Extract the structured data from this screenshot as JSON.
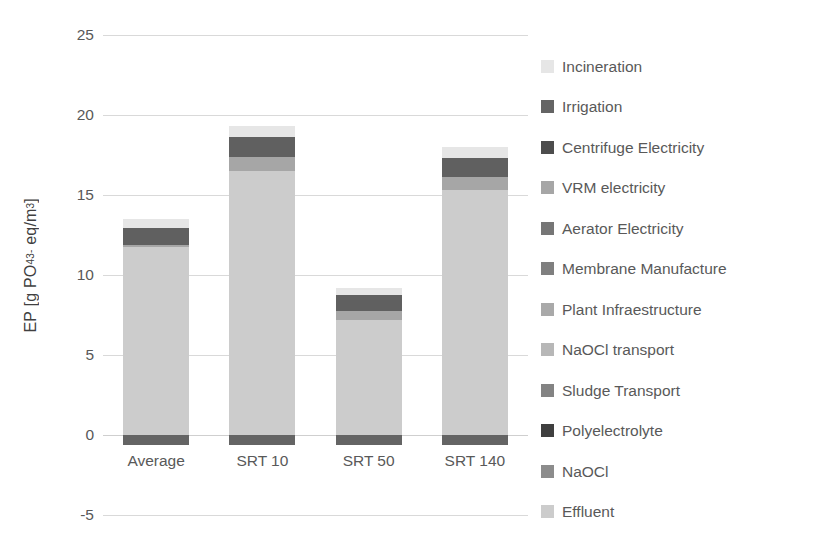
{
  "chart_data": {
    "type": "bar",
    "stacked": true,
    "title": "",
    "xlabel": "",
    "ylabel": "EP [g PO4 3- eq/m3]",
    "ylabel_parts": {
      "prefix": "EP [g PO",
      "sub": "4",
      "sup": "3-",
      "suffix": " eq/m",
      "unit_sup": "3",
      "close": "]"
    },
    "categories": [
      "Average",
      "SRT 10",
      "SRT 50",
      "SRT 140"
    ],
    "ylim": [
      -5,
      25
    ],
    "yticks": [
      25,
      20,
      15,
      10,
      5,
      0,
      -5
    ],
    "grid": true,
    "legend_position": "right",
    "series": [
      {
        "name": "Incineration",
        "color": "#e6e6e6",
        "values": [
          0.55,
          0.7,
          0.45,
          0.7
        ]
      },
      {
        "name": "Irrigation",
        "color": "#646464",
        "values": [
          -0.6,
          -0.6,
          -0.6,
          -0.6
        ]
      },
      {
        "name": "Centrifuge Electricity",
        "color": "#606060",
        "values": [
          1.1,
          1.2,
          1.0,
          1.15
        ]
      },
      {
        "name": "VRM electricity",
        "color": "#a6a6a6",
        "values": [
          0.1,
          0.9,
          0.55,
          0.85
        ]
      },
      {
        "name": "Aerator Electricity",
        "color": "#767676",
        "values": [
          0.0,
          0.0,
          0.0,
          0.0
        ]
      },
      {
        "name": "Membrane Manufacture",
        "color": "#7f7f7f",
        "values": [
          0.0,
          0.0,
          0.0,
          0.0
        ]
      },
      {
        "name": "Plant Infraestructure",
        "color": "#a9a9a9",
        "values": [
          0.0,
          0.0,
          0.0,
          0.0
        ]
      },
      {
        "name": "NaOCl transport",
        "color": "#b7b7b7",
        "values": [
          0.0,
          0.0,
          0.0,
          0.0
        ]
      },
      {
        "name": "Sludge Transport",
        "color": "#838383",
        "values": [
          0.0,
          0.0,
          0.0,
          0.0
        ]
      },
      {
        "name": "Polyelectrolyte",
        "color": "#3f3f3f",
        "values": [
          0.0,
          0.0,
          0.0,
          0.0
        ]
      },
      {
        "name": "NaOCl",
        "color": "#8c8c8c",
        "values": [
          0.0,
          0.0,
          0.0,
          0.0
        ]
      },
      {
        "name": "Effluent",
        "color": "#cccccc",
        "values": [
          11.75,
          16.5,
          7.2,
          15.3
        ]
      }
    ],
    "totals_positive": [
      13.5,
      19.3,
      9.2,
      18.0
    ],
    "stack_order_bottom_to_top": [
      "Effluent",
      "VRM electricity",
      "Centrifuge Electricity",
      "Incineration"
    ],
    "negative_series": "Irrigation",
    "colors": {
      "gridline": "#d9d9d9",
      "tick_text": "#595959",
      "axis_title": "#404040",
      "background": "#ffffff"
    }
  },
  "legend": {
    "items": [
      {
        "label": "Incineration",
        "color": "#e6e6e6"
      },
      {
        "label": "Irrigation",
        "color": "#646464"
      },
      {
        "label": "Centrifuge Electricity",
        "color": "#4d4d4d"
      },
      {
        "label": "VRM electricity",
        "color": "#a6a6a6"
      },
      {
        "label": "Aerator Electricity",
        "color": "#767676"
      },
      {
        "label": "Membrane Manufacture",
        "color": "#7f7f7f"
      },
      {
        "label": "Plant Infraestructure",
        "color": "#a9a9a9"
      },
      {
        "label": "NaOCl transport",
        "color": "#b7b7b7"
      },
      {
        "label": "Sludge Transport",
        "color": "#838383"
      },
      {
        "label": "Polyelectrolyte",
        "color": "#3f3f3f"
      },
      {
        "label": "NaOCl",
        "color": "#8c8c8c"
      },
      {
        "label": "Effluent",
        "color": "#cccccc"
      }
    ]
  }
}
